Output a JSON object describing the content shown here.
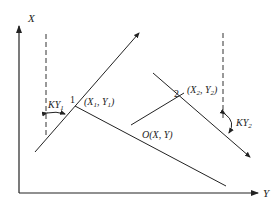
{
  "diagram": {
    "axes": {
      "x_label": "X",
      "y_label": "Y"
    },
    "points": {
      "p1": {
        "number": "1",
        "label_prefix": "(X",
        "label_sub1": "1",
        "label_mid": ", Y",
        "label_sub2": "1",
        "label_suffix": ")"
      },
      "p2": {
        "number": "2",
        "label_prefix": "(X",
        "label_sub1": "2",
        "label_mid": ", Y",
        "label_sub2": "2",
        "label_suffix": ")"
      },
      "origin": {
        "label": "O(X, Y)"
      }
    },
    "angles": {
      "ky1": {
        "main": "KY",
        "sub": "1"
      },
      "ky2": {
        "main": "KY",
        "sub": "2"
      }
    },
    "colors": {
      "line": "#222222",
      "background": "#ffffff"
    }
  }
}
